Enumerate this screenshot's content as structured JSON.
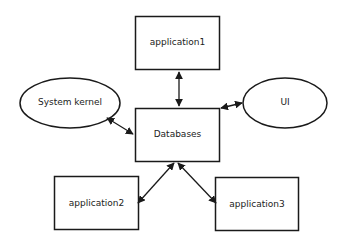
{
  "diagram": {
    "nodes": {
      "application1": {
        "label": "application1",
        "shape": "rectangle"
      },
      "system_kernel": {
        "label": "System kernel",
        "shape": "ellipse"
      },
      "databases": {
        "label": "Databases",
        "shape": "rectangle"
      },
      "ui": {
        "label": "UI",
        "shape": "ellipse"
      },
      "application2": {
        "label": "application2",
        "shape": "rectangle"
      },
      "application3": {
        "label": "application3",
        "shape": "rectangle"
      }
    },
    "edges": [
      {
        "from": "application1",
        "to": "databases",
        "arrow": "bidirectional"
      },
      {
        "from": "system_kernel",
        "to": "databases",
        "arrow": "bidirectional"
      },
      {
        "from": "ui",
        "to": "databases",
        "arrow": "bidirectional"
      },
      {
        "from": "application2",
        "to": "databases",
        "arrow": "bidirectional"
      },
      {
        "from": "application3",
        "to": "databases",
        "arrow": "bidirectional"
      }
    ],
    "colors": {
      "stroke": "#1a1a1a",
      "fill": "#ffffff",
      "text": "#222222"
    }
  }
}
